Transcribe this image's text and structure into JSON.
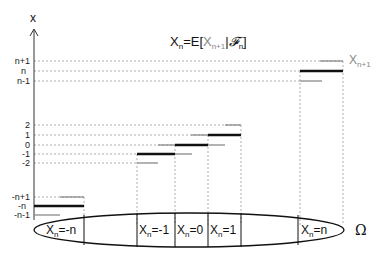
{
  "title": {
    "lhs": "X",
    "lhs_sub": "n",
    "eq": "=E[",
    "mid": "X",
    "mid_sub": "n+1",
    "bar": "|",
    "sigma": "𝓕",
    "sigma_sub": "n",
    "close": "]"
  },
  "axis": {
    "label": "x",
    "ticks": [
      {
        "label": "n+1",
        "y": 61
      },
      {
        "label": "n",
        "y": 71
      },
      {
        "label": "n-1",
        "y": 81
      },
      {
        "label": "2",
        "y": 125
      },
      {
        "label": "1",
        "y": 135
      },
      {
        "label": "0",
        "y": 145
      },
      {
        "label": "-1",
        "y": 154
      },
      {
        "label": "-2",
        "y": 163
      },
      {
        "label": "-n+1",
        "y": 197
      },
      {
        "label": "-n",
        "y": 206
      },
      {
        "label": "-n-1",
        "y": 215
      }
    ]
  },
  "legend_right": {
    "label": "X",
    "sub": "n+1"
  },
  "omega": "Ω",
  "partitions": [
    {
      "label": "X",
      "sub": "n",
      "value": "=-n"
    },
    {
      "label": "X",
      "sub": "n",
      "value": "=-1"
    },
    {
      "label": "X",
      "sub": "n",
      "value": "=0"
    },
    {
      "label": "X",
      "sub": "n",
      "value": "=1"
    },
    {
      "label": "X",
      "sub": "n",
      "value": "=n"
    }
  ],
  "colors": {
    "black": "#111111",
    "gray": "#8a8a8a",
    "dotted": "#9a9a9a"
  }
}
